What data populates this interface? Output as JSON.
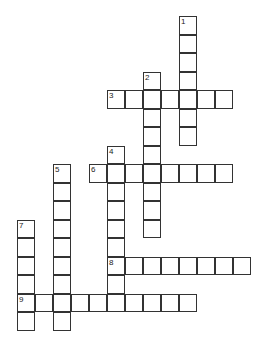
{
  "puzzle": {
    "type": "crossword",
    "grid_origin": {
      "x": 17,
      "y": 16
    },
    "cell_width": 18,
    "cell_height": 18.5,
    "entries": [
      {
        "number": "1",
        "direction": "down",
        "col": 9,
        "row": 0,
        "length": 7
      },
      {
        "number": "2",
        "direction": "down",
        "col": 7,
        "row": 3,
        "length": 9
      },
      {
        "number": "3",
        "direction": "across",
        "col": 5,
        "row": 4,
        "length": 7
      },
      {
        "number": "4",
        "direction": "down",
        "col": 5,
        "row": 7,
        "length": 9
      },
      {
        "number": "5",
        "direction": "down",
        "col": 2,
        "row": 8,
        "length": 9
      },
      {
        "number": "6",
        "direction": "across",
        "col": 4,
        "row": 8,
        "length": 8
      },
      {
        "number": "7",
        "direction": "down",
        "col": 0,
        "row": 11,
        "length": 6
      },
      {
        "number": "8",
        "direction": "across",
        "col": 5,
        "row": 13,
        "length": 8
      },
      {
        "number": "9",
        "direction": "across",
        "col": 0,
        "row": 15,
        "length": 10
      }
    ]
  }
}
